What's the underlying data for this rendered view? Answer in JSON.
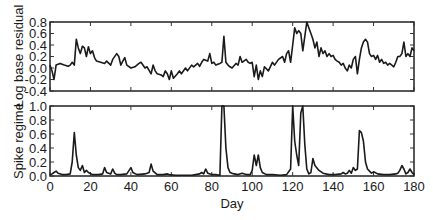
{
  "chart_data": [
    {
      "type": "line",
      "panel": "top",
      "title": "",
      "xlabel": "",
      "ylabel": "Log base residual",
      "xlim": [
        0,
        180
      ],
      "ylim": [
        -0.4,
        0.8
      ],
      "yticks": [
        "0.8",
        "0.6",
        "0.4",
        "0.2",
        "0.0",
        "-0.2",
        "-0.4"
      ],
      "grid": false,
      "legend": null,
      "x": [
        0,
        1,
        2,
        3,
        5,
        7,
        9,
        10,
        11,
        12,
        13,
        14,
        15,
        16,
        17,
        18,
        19,
        20,
        21,
        22,
        23,
        25,
        27,
        28,
        30,
        31,
        33,
        34,
        35,
        36,
        37,
        38,
        40,
        42,
        44,
        45,
        47,
        48,
        50,
        51,
        52,
        53,
        55,
        56,
        57,
        58,
        59,
        60,
        61,
        63,
        64,
        65,
        67,
        68,
        70,
        71,
        73,
        74,
        75,
        76,
        78,
        79,
        80,
        81,
        82,
        84,
        85,
        86,
        87,
        88,
        89,
        90,
        92,
        93,
        94,
        95,
        97,
        98,
        99,
        100,
        101,
        102,
        103,
        104,
        105,
        106,
        108,
        110,
        111,
        113,
        115,
        116,
        117,
        118,
        119,
        120,
        121,
        122,
        123,
        124,
        125,
        126,
        127,
        128,
        129,
        130,
        131,
        132,
        133,
        134,
        135,
        136,
        137,
        138,
        139,
        140,
        141,
        142,
        143,
        144,
        145,
        146,
        147,
        148,
        149,
        150,
        151,
        152,
        153,
        154,
        155,
        156,
        157,
        158,
        159,
        160,
        161,
        162,
        163,
        164,
        165,
        166,
        167,
        168,
        169,
        170,
        171,
        172,
        173,
        174,
        175,
        176,
        177,
        178,
        179,
        180
      ],
      "values": [
        0.05,
        -0.05,
        -0.2,
        0.05,
        0.08,
        0.05,
        0.03,
        0.05,
        0.1,
        0.05,
        0.5,
        0.35,
        0.25,
        0.38,
        0.35,
        0.2,
        0.37,
        0.25,
        0.3,
        0.18,
        0.12,
        0.1,
        0.08,
        0.12,
        0.05,
        0.15,
        0.25,
        0.2,
        0.05,
        0.12,
        0.18,
        0.05,
        0.0,
        0.02,
        0.08,
        0.1,
        0.0,
        0.02,
        -0.1,
        0.05,
        -0.05,
        -0.1,
        -0.12,
        -0.15,
        -0.05,
        -0.1,
        -0.2,
        -0.05,
        -0.18,
        -0.1,
        -0.05,
        -0.1,
        0.0,
        -0.05,
        0.05,
        0.02,
        0.08,
        0.03,
        0.1,
        0.15,
        0.12,
        0.25,
        0.08,
        0.1,
        0.05,
        0.08,
        0.1,
        0.55,
        0.1,
        0.05,
        0.02,
        0.0,
        0.08,
        0.05,
        0.2,
        0.1,
        0.15,
        0.1,
        0.08,
        0.1,
        -0.15,
        0.05,
        -0.2,
        -0.05,
        -0.15,
        0.02,
        -0.05,
        0.1,
        0.05,
        0.15,
        0.2,
        0.1,
        0.25,
        0.3,
        0.1,
        0.4,
        0.7,
        0.6,
        0.65,
        0.6,
        0.3,
        0.55,
        0.8,
        0.7,
        0.6,
        0.5,
        0.35,
        0.45,
        0.2,
        0.35,
        0.25,
        0.3,
        0.2,
        0.25,
        0.2,
        0.22,
        0.15,
        0.12,
        0.1,
        0.05,
        0.08,
        0.0,
        -0.05,
        0.05,
        0.0,
        0.15,
        0.2,
        -0.1,
        0.15,
        0.35,
        0.45,
        0.5,
        0.45,
        0.25,
        0.2,
        0.22,
        0.15,
        0.22,
        0.1,
        0.15,
        0.08,
        0.1,
        0.05,
        0.08,
        0.05,
        0.02,
        0.1,
        0.2,
        0.2,
        0.25,
        0.45,
        0.2,
        0.25,
        0.2,
        0.35,
        0.3
      ]
    },
    {
      "type": "line",
      "panel": "bottom",
      "title": "",
      "xlabel": "Day",
      "ylabel": "Spike regime",
      "xlim": [
        0,
        180
      ],
      "ylim": [
        0.0,
        1.0
      ],
      "xticks": [
        "0",
        "20",
        "40",
        "60",
        "80",
        "100",
        "120",
        "140",
        "160",
        "180"
      ],
      "yticks": [
        "1.0",
        "0.8",
        "0.6",
        "0.4",
        "0.2",
        "0.0"
      ],
      "grid": false,
      "legend": null,
      "x": [
        0,
        1,
        2,
        3,
        4,
        6,
        8,
        10,
        11,
        12,
        13,
        14,
        15,
        16,
        17,
        18,
        19,
        21,
        24,
        26,
        27,
        28,
        30,
        31,
        32,
        33,
        35,
        38,
        40,
        41,
        43,
        47,
        49,
        50,
        51,
        53,
        56,
        58,
        59,
        62,
        66,
        70,
        72,
        74,
        75,
        76,
        77,
        78,
        80,
        82,
        84,
        85,
        86,
        87,
        88,
        89,
        91,
        93,
        95,
        97,
        99,
        100,
        101,
        102,
        103,
        104,
        105,
        107,
        110,
        114,
        117,
        119,
        120,
        121,
        122,
        123,
        124,
        125,
        126,
        127,
        128,
        129,
        130,
        131,
        133,
        135,
        138,
        141,
        144,
        145,
        146,
        147,
        148,
        149,
        150,
        151,
        152,
        153,
        154,
        155,
        156,
        157,
        158,
        159,
        160,
        162,
        165,
        168,
        171,
        172,
        173,
        174,
        175,
        176,
        177,
        178,
        179,
        180
      ],
      "values": [
        0.02,
        0.03,
        0.05,
        0.07,
        0.04,
        0.02,
        0.02,
        0.03,
        0.2,
        0.62,
        0.3,
        0.12,
        0.08,
        0.15,
        0.05,
        0.08,
        0.05,
        0.02,
        0.02,
        0.03,
        0.12,
        0.05,
        0.03,
        0.1,
        0.04,
        0.02,
        0.02,
        0.03,
        0.12,
        0.05,
        0.02,
        0.03,
        0.05,
        0.17,
        0.07,
        0.02,
        0.02,
        0.03,
        0.02,
        0.01,
        0.01,
        0.01,
        0.02,
        0.03,
        0.05,
        0.03,
        0.1,
        0.04,
        0.02,
        0.02,
        0.01,
        1.0,
        1.0,
        0.4,
        0.12,
        0.05,
        0.03,
        0.02,
        0.04,
        0.02,
        0.02,
        0.08,
        0.3,
        0.15,
        0.3,
        0.12,
        0.05,
        0.02,
        0.02,
        0.01,
        0.02,
        0.1,
        1.0,
        0.5,
        0.3,
        0.15,
        0.9,
        1.0,
        0.45,
        0.1,
        0.03,
        0.05,
        0.25,
        0.15,
        0.08,
        0.04,
        0.02,
        0.02,
        0.03,
        0.05,
        0.03,
        0.04,
        0.08,
        0.04,
        0.12,
        0.08,
        0.1,
        0.65,
        0.62,
        0.5,
        0.2,
        0.1,
        0.07,
        0.04,
        0.06,
        0.03,
        0.02,
        0.02,
        0.03,
        0.04,
        0.08,
        0.15,
        0.1,
        0.03,
        0.05,
        0.1,
        0.05,
        0.02
      ]
    }
  ]
}
